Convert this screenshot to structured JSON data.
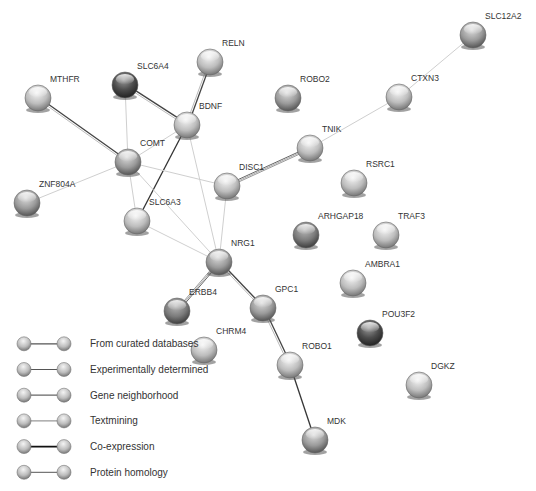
{
  "network": {
    "nodes": [
      {
        "id": "MTHFR",
        "x": 38,
        "y": 98,
        "shade": "light"
      },
      {
        "id": "SLC6A4",
        "x": 125,
        "y": 85,
        "shade": "dark"
      },
      {
        "id": "RELN",
        "x": 210,
        "y": 62,
        "shade": "light"
      },
      {
        "id": "BDNF",
        "x": 187,
        "y": 125,
        "shade": "light"
      },
      {
        "id": "COMT",
        "x": 128,
        "y": 162,
        "shade": "medium"
      },
      {
        "id": "ZNF804A",
        "x": 27,
        "y": 203,
        "shade": "medium"
      },
      {
        "id": "SLC6A3",
        "x": 137,
        "y": 221,
        "shade": "light"
      },
      {
        "id": "DISC1",
        "x": 227,
        "y": 186,
        "shade": "light"
      },
      {
        "id": "NRG1",
        "x": 219,
        "y": 262,
        "shade": "medium"
      },
      {
        "id": "ERBB4",
        "x": 177,
        "y": 311,
        "shade": "mediumdark"
      },
      {
        "id": "GPC1",
        "x": 263,
        "y": 308,
        "shade": "medium"
      },
      {
        "id": "CHRM4",
        "x": 204,
        "y": 350,
        "shade": "light"
      },
      {
        "id": "ROBO1",
        "x": 290,
        "y": 365,
        "shade": "light"
      },
      {
        "id": "MDK",
        "x": 315,
        "y": 440,
        "shade": "medium"
      },
      {
        "id": "ROBO2",
        "x": 288,
        "y": 98,
        "shade": "medium"
      },
      {
        "id": "CTXN3",
        "x": 399,
        "y": 97,
        "shade": "light"
      },
      {
        "id": "SLC12A2",
        "x": 473,
        "y": 35,
        "shade": "medium"
      },
      {
        "id": "TNIK",
        "x": 310,
        "y": 148,
        "shade": "light"
      },
      {
        "id": "RSRC1",
        "x": 354,
        "y": 183,
        "shade": "light"
      },
      {
        "id": "ARHGAP18",
        "x": 306,
        "y": 235,
        "shade": "mediumdark"
      },
      {
        "id": "TRAF3",
        "x": 386,
        "y": 235,
        "shade": "light"
      },
      {
        "id": "AMBRA1",
        "x": 353,
        "y": 283,
        "shade": "light"
      },
      {
        "id": "POU3F2",
        "x": 370,
        "y": 333,
        "shade": "dark"
      },
      {
        "id": "DGKZ",
        "x": 419,
        "y": 385,
        "shade": "light"
      }
    ],
    "edges": [
      {
        "a": "MTHFR",
        "b": "COMT",
        "style": "strong"
      },
      {
        "a": "SLC6A4",
        "b": "BDNF",
        "style": "strong"
      },
      {
        "a": "SLC6A4",
        "b": "COMT",
        "style": "faint"
      },
      {
        "a": "RELN",
        "b": "BDNF",
        "style": "strong"
      },
      {
        "a": "BDNF",
        "b": "COMT",
        "style": "faint"
      },
      {
        "a": "BDNF",
        "b": "SLC6A3",
        "style": "dark"
      },
      {
        "a": "BDNF",
        "b": "NRG1",
        "style": "faint"
      },
      {
        "a": "COMT",
        "b": "ZNF804A",
        "style": "faint"
      },
      {
        "a": "COMT",
        "b": "DISC1",
        "style": "faint"
      },
      {
        "a": "COMT",
        "b": "SLC6A3",
        "style": "faint"
      },
      {
        "a": "COMT",
        "b": "NRG1",
        "style": "faint"
      },
      {
        "a": "SLC6A3",
        "b": "NRG1",
        "style": "faint"
      },
      {
        "a": "DISC1",
        "b": "NRG1",
        "style": "faint"
      },
      {
        "a": "DISC1",
        "b": "TNIK",
        "style": "double"
      },
      {
        "a": "TNIK",
        "b": "CTXN3",
        "style": "faint"
      },
      {
        "a": "CTXN3",
        "b": "SLC12A2",
        "style": "faint"
      },
      {
        "a": "NRG1",
        "b": "ERBB4",
        "style": "double"
      },
      {
        "a": "NRG1",
        "b": "GPC1",
        "style": "strong"
      },
      {
        "a": "GPC1",
        "b": "ROBO1",
        "style": "strong"
      },
      {
        "a": "ROBO1",
        "b": "MDK",
        "style": "dark"
      }
    ]
  },
  "labels": {
    "MTHFR": "MTHFR",
    "SLC6A4": "SLC6A4",
    "RELN": "RELN",
    "BDNF": "BDNF",
    "COMT": "COMT",
    "ZNF804A": "ZNF804A",
    "SLC6A3": "SLC6A3",
    "DISC1": "DISC1",
    "NRG1": "NRG1",
    "ERBB4": "ERBB4",
    "GPC1": "GPC1",
    "CHRM4": "CHRM4",
    "ROBO1": "ROBO1",
    "MDK": "MDK",
    "ROBO2": "ROBO2",
    "CTXN3": "CTXN3",
    "SLC12A2": "SLC12A2",
    "TNIK": "TNIK",
    "RSRC1": "RSRC1",
    "ARHGAP18": "ARHGAP18",
    "TRAF3": "TRAF3",
    "AMBRA1": "AMBRA1",
    "POU3F2": "POU3F2",
    "DGKZ": "DGKZ"
  },
  "legend": {
    "items": [
      {
        "label": "From curated databases",
        "line_color": "#555555"
      },
      {
        "label": "Experimentally determined",
        "line_color": "#555555"
      },
      {
        "label": "Gene neighborhood",
        "line_color": "#666666"
      },
      {
        "label": "Textmining",
        "line_color": "#999999"
      },
      {
        "label": "Co-expression",
        "line_color": "#111111"
      },
      {
        "label": "Protein homology",
        "line_color": "#777777"
      }
    ]
  }
}
